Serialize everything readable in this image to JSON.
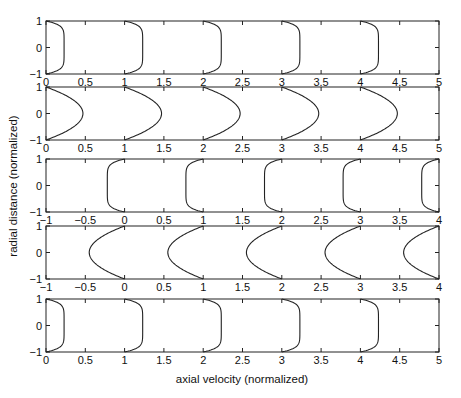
{
  "chart_data": {
    "type": "line",
    "title": "",
    "xlabel": "axial velocity (normalized)",
    "ylabel": "radial distance (normalized)",
    "grid": false,
    "legend": null,
    "panels": [
      {
        "name": "panel-1",
        "profile": "blunt",
        "direction": 1,
        "amplitude": 0.23,
        "offsets": [
          0,
          1,
          2,
          3,
          4
        ],
        "xlim": [
          0,
          5
        ],
        "ylim": [
          -1,
          1
        ],
        "xticks": [
          "0",
          "0.5",
          "1",
          "1.5",
          "2",
          "2.5",
          "3",
          "3.5",
          "4",
          "4.5",
          "5"
        ],
        "yticks": [
          "-1",
          "0",
          "1"
        ]
      },
      {
        "name": "panel-2",
        "profile": "parabolic",
        "direction": 1,
        "amplitude": 0.47,
        "offsets": [
          0,
          1,
          2,
          3,
          4
        ],
        "xlim": [
          0,
          5
        ],
        "ylim": [
          -1,
          1
        ],
        "xticks": [
          "0",
          "0.5",
          "1",
          "1.5",
          "2",
          "2.5",
          "3",
          "3.5",
          "4",
          "4.5",
          "5"
        ],
        "yticks": [
          "-1",
          "0",
          "1"
        ]
      },
      {
        "name": "panel-3",
        "profile": "blunt",
        "direction": -1,
        "amplitude": 0.22,
        "offsets": [
          0,
          1,
          2,
          3,
          4
        ],
        "xlim": [
          -1,
          4
        ],
        "ylim": [
          -1,
          1
        ],
        "xticks": [
          "-1",
          "-0.5",
          "0",
          "0.5",
          "1",
          "1.5",
          "2",
          "2.5",
          "3",
          "3.5",
          "4"
        ],
        "yticks": [
          "-1",
          "0",
          "1"
        ]
      },
      {
        "name": "panel-4",
        "profile": "parabolic",
        "direction": -1,
        "amplitude": 0.45,
        "offsets": [
          0,
          1,
          2,
          3,
          4
        ],
        "xlim": [
          -1,
          4
        ],
        "ylim": [
          -1,
          1
        ],
        "xticks": [
          "-1",
          "-0.5",
          "0",
          "0.5",
          "1",
          "1.5",
          "2",
          "2.5",
          "3",
          "3.5",
          "4"
        ],
        "yticks": [
          "-1",
          "0",
          "1"
        ]
      },
      {
        "name": "panel-5",
        "profile": "blunt",
        "direction": 1,
        "amplitude": 0.23,
        "offsets": [
          0,
          1,
          2,
          3,
          4
        ],
        "xlim": [
          0,
          5
        ],
        "ylim": [
          -1,
          1
        ],
        "xticks": [
          "0",
          "0.5",
          "1",
          "1.5",
          "2",
          "2.5",
          "3",
          "3.5",
          "4",
          "4.5",
          "5"
        ],
        "yticks": [
          "-1",
          "0",
          "1"
        ]
      }
    ]
  },
  "layout": {
    "panel_left": 46,
    "panel_right": 439,
    "panel_tops": [
      21,
      87,
      159,
      226,
      299
    ],
    "panel_height": 53
  }
}
